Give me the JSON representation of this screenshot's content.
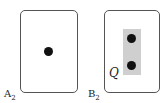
{
  "panels": [
    {
      "label": "A",
      "subscript": "2",
      "dots": 1
    },
    {
      "label": "B",
      "subscript": "2",
      "dots": 2,
      "region_label": "Q",
      "region_color": "#cfcfcf"
    }
  ]
}
